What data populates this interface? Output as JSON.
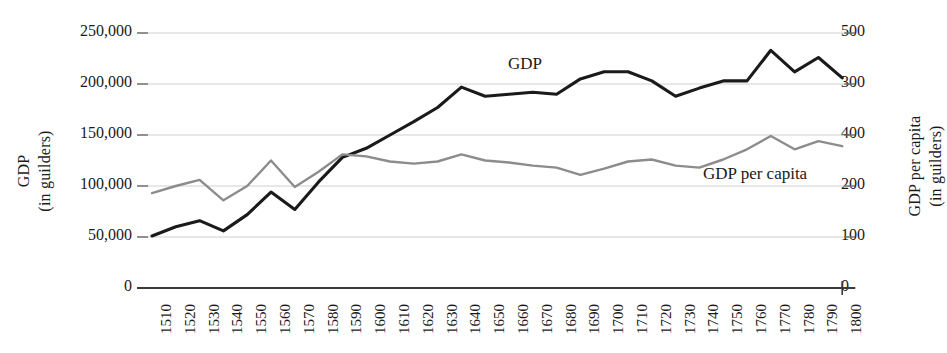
{
  "chart_data": {
    "type": "line",
    "title": "",
    "xlabel": "",
    "x": [
      1510,
      1520,
      1530,
      1540,
      1550,
      1560,
      1570,
      1580,
      1590,
      1600,
      1610,
      1620,
      1630,
      1640,
      1650,
      1660,
      1670,
      1680,
      1690,
      1700,
      1710,
      1720,
      1730,
      1740,
      1750,
      1760,
      1770,
      1780,
      1790,
      1800
    ],
    "categories": [
      "1510",
      "1520",
      "1530",
      "1540",
      "1550",
      "1560",
      "1570",
      "1580",
      "1590",
      "1600",
      "1610",
      "1620",
      "1630",
      "1640",
      "1650",
      "1660",
      "1670",
      "1680",
      "1690",
      "1700",
      "1710",
      "1720",
      "1730",
      "1740",
      "1750",
      "1760",
      "1770",
      "1780",
      "1790",
      "1800"
    ],
    "grid": true,
    "legend_position": "inline-annotation",
    "series": [
      {
        "name": "GDP",
        "axis": "left",
        "color": "#1a1a1a",
        "unit": "guilders",
        "values": [
          51000,
          60000,
          66000,
          56000,
          72000,
          94000,
          77000,
          104000,
          128000,
          137000,
          150000,
          163000,
          177000,
          197000,
          188000,
          190000,
          192000,
          190000,
          205000,
          212000,
          212000,
          203000,
          188000,
          196000,
          203000,
          203000,
          233000,
          212000,
          226000,
          206000
        ]
      },
      {
        "name": "GDP per capita",
        "axis": "right",
        "color": "#8c8c8c",
        "unit": "guilders",
        "values": [
          186,
          200,
          212,
          172,
          200,
          250,
          198,
          228,
          262,
          258,
          248,
          244,
          248,
          262,
          250,
          246,
          240,
          236,
          222,
          234,
          248,
          252,
          240,
          236,
          252,
          272,
          298,
          272,
          288,
          278
        ]
      }
    ],
    "axes": {
      "left": {
        "label_lines": [
          "GDP",
          "(in guilders)"
        ],
        "ticks": [
          "250,000",
          "200,000",
          "150,000",
          "100,000",
          "50,000",
          "0"
        ],
        "tick_values": [
          250000,
          200000,
          150000,
          100000,
          50000,
          0
        ],
        "ylim": [
          0,
          250000
        ]
      },
      "right": {
        "label_lines": [
          "GDP per capita",
          "(in guilders)"
        ],
        "ticks": [
          "500",
          "300",
          "400",
          "200",
          "100",
          "0"
        ],
        "tick_values": [
          500,
          300,
          400,
          200,
          100,
          0
        ],
        "ylim": [
          0,
          500
        ]
      }
    },
    "annotations": [
      {
        "text": "GDP",
        "series": "GDP"
      },
      {
        "text": "GDP per capita",
        "series": "GDP per capita"
      }
    ]
  },
  "colors": {
    "gdp_line": "#1a1a1a",
    "gdp_per_capita_line": "#8c8c8c",
    "gridline": "#cfcfcf",
    "axis": "#3a3a3a",
    "background": "#ffffff"
  }
}
